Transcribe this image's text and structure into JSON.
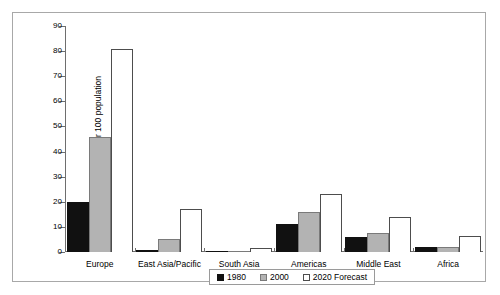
{
  "chart_data": {
    "type": "bar",
    "title": "",
    "xlabel": "",
    "ylabel": "Arrivals generated per 100 population",
    "ylim": [
      0,
      90
    ],
    "yticks": [
      0,
      10,
      20,
      30,
      40,
      50,
      60,
      70,
      80,
      90
    ],
    "grid": false,
    "legend_position": "bottom-center",
    "categories": [
      "Europe",
      "East Asia/Pacific",
      "South Asia",
      "Americas",
      "Middle East",
      "Africa"
    ],
    "series": [
      {
        "name": "1980",
        "color": "#111111",
        "values": [
          20,
          1,
          0.3,
          11,
          6,
          2
        ]
      },
      {
        "name": "2000",
        "color": "#b3b3b3",
        "values": [
          46,
          5,
          0.6,
          16,
          7.5,
          2
        ]
      },
      {
        "name": "2020 Forecast",
        "color": "#ffffff",
        "values": [
          81,
          17,
          1.5,
          23,
          14,
          6.5
        ]
      }
    ]
  },
  "axis": {
    "y_title": "Arrivals generated per 100 population",
    "y_labels": [
      "90",
      "80",
      "70",
      "60",
      "50",
      "40",
      "30",
      "20",
      "10",
      "0"
    ]
  },
  "legend": {
    "items": [
      {
        "label": "1980"
      },
      {
        "label": "2000"
      },
      {
        "label": "2020 Forecast"
      }
    ]
  }
}
